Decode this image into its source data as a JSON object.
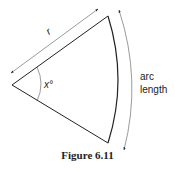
{
  "figure": {
    "caption": "Figure 6.11",
    "labels": {
      "radius": "r",
      "angle": "x°",
      "arc_line1": "arc",
      "arc_line2": "length"
    },
    "colors": {
      "stroke": "#222222",
      "dimension": "#555555"
    }
  }
}
